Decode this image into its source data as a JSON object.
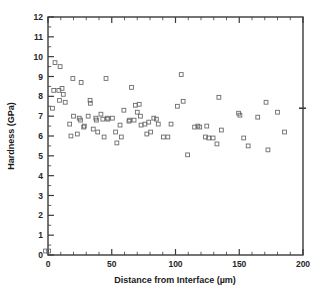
{
  "chart_data": {
    "type": "scatter",
    "title": "",
    "xlabel": "Distance from Interface (µm)",
    "ylabel": "Hardness (GPa)",
    "xlim": [
      0,
      200
    ],
    "ylim": [
      0,
      12
    ],
    "grid": false,
    "legend": "none",
    "marker": "open-square",
    "marker_color": "#6b6b6b",
    "x_major_ticks": [
      0,
      50,
      100,
      150,
      200
    ],
    "x_tick_labels": [
      "0",
      "50",
      "100",
      "150",
      "200"
    ],
    "x_minor_step": 10,
    "y_major_ticks": [
      0,
      1,
      2,
      3,
      4,
      5,
      6,
      7,
      8,
      9,
      10,
      11,
      12
    ],
    "y_tick_labels": [
      "0",
      "1",
      "2",
      "3",
      "4",
      "5",
      "6",
      "7",
      "8",
      "9",
      "10",
      "11",
      "12"
    ],
    "y_minor_step": 0.5,
    "series": [
      {
        "name": "Hardness measurements",
        "points": [
          [
            -2.0,
            0.2
          ],
          [
            0.5,
            0.2
          ],
          [
            3.5,
            7.4
          ],
          [
            4.5,
            8.3
          ],
          [
            5.5,
            9.7
          ],
          [
            8.5,
            8.3
          ],
          [
            9.0,
            7.8
          ],
          [
            9.5,
            9.5
          ],
          [
            11.0,
            8.4
          ],
          [
            12.0,
            8.1
          ],
          [
            13.5,
            7.7
          ],
          [
            17.0,
            6.6
          ],
          [
            18.0,
            6.0
          ],
          [
            19.5,
            8.9
          ],
          [
            20.0,
            7.0
          ],
          [
            23.0,
            6.1
          ],
          [
            24.5,
            6.9
          ],
          [
            25.5,
            6.8
          ],
          [
            26.0,
            8.7
          ],
          [
            28.0,
            6.45
          ],
          [
            28.5,
            6.5
          ],
          [
            31.5,
            7.0
          ],
          [
            33.0,
            7.8
          ],
          [
            33.2,
            7.65
          ],
          [
            35.5,
            6.35
          ],
          [
            37.5,
            6.9
          ],
          [
            38.0,
            6.8
          ],
          [
            39.0,
            6.2
          ],
          [
            41.5,
            7.1
          ],
          [
            43.0,
            6.85
          ],
          [
            44.0,
            5.95
          ],
          [
            45.5,
            8.9
          ],
          [
            46.5,
            6.9
          ],
          [
            47.0,
            6.85
          ],
          [
            50.5,
            6.9
          ],
          [
            53.0,
            6.2
          ],
          [
            54.0,
            5.65
          ],
          [
            56.5,
            6.55
          ],
          [
            57.5,
            5.95
          ],
          [
            59.5,
            7.3
          ],
          [
            63.5,
            6.75
          ],
          [
            64.0,
            6.8
          ],
          [
            65.5,
            8.45
          ],
          [
            67.5,
            6.8
          ],
          [
            68.5,
            7.55
          ],
          [
            70.0,
            7.2
          ],
          [
            71.5,
            7.6
          ],
          [
            72.5,
            7.0
          ],
          [
            73.0,
            6.55
          ],
          [
            76.0,
            6.6
          ],
          [
            77.5,
            6.1
          ],
          [
            79.0,
            6.7
          ],
          [
            80.5,
            6.2
          ],
          [
            83.0,
            6.9
          ],
          [
            85.0,
            6.85
          ],
          [
            86.5,
            6.6
          ],
          [
            90.5,
            5.95
          ],
          [
            94.0,
            5.95
          ],
          [
            96.5,
            6.6
          ],
          [
            101.5,
            7.5
          ],
          [
            104.5,
            9.1
          ],
          [
            106.0,
            7.75
          ],
          [
            109.5,
            5.05
          ],
          [
            115.0,
            6.45
          ],
          [
            117.5,
            6.5
          ],
          [
            119.0,
            6.45
          ],
          [
            123.5,
            5.95
          ],
          [
            124.5,
            6.5
          ],
          [
            126.0,
            5.9
          ],
          [
            129.5,
            5.9
          ],
          [
            132.5,
            5.6
          ],
          [
            134.0,
            7.95
          ],
          [
            136.0,
            6.3
          ],
          [
            149.5,
            7.15
          ],
          [
            150.5,
            7.05
          ],
          [
            153.5,
            5.9
          ],
          [
            157.0,
            5.5
          ],
          [
            164.5,
            6.95
          ],
          [
            171.0,
            7.7
          ],
          [
            172.5,
            5.3
          ],
          [
            180.0,
            7.2
          ],
          [
            185.5,
            6.2
          ]
        ]
      }
    ],
    "right_axis_marker": {
      "value": 7.4,
      "visible": true
    }
  }
}
